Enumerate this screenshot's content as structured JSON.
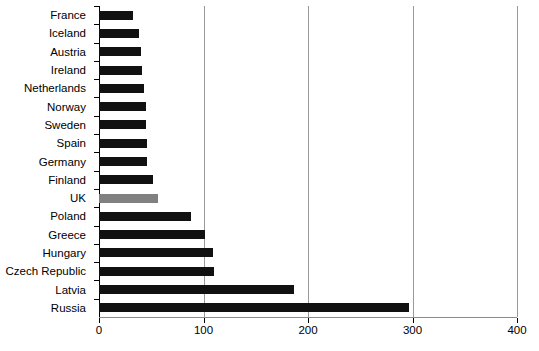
{
  "chart_data": {
    "type": "bar",
    "orientation": "horizontal",
    "title": "",
    "subtitle": "",
    "xlabel": "",
    "ylabel": "",
    "xlim": [
      0,
      400
    ],
    "xticks": [
      0,
      100,
      200,
      300,
      400
    ],
    "xtick_labels": [
      "0",
      "100",
      "200",
      "300",
      "400"
    ],
    "grid": "vertical",
    "legend": "none",
    "categories": [
      "France",
      "Iceland",
      "Austria",
      "Ireland",
      "Netherlands",
      "Norway",
      "Sweden",
      "Spain",
      "Germany",
      "Finland",
      "UK",
      "Poland",
      "Greece",
      "Hungary",
      "Czech Republic",
      "Latvia",
      "Russia"
    ],
    "values": [
      33,
      38,
      40,
      41,
      43,
      45,
      45,
      46,
      46,
      52,
      56,
      88,
      101,
      109,
      110,
      187,
      297
    ],
    "highlight_category": "UK",
    "colors": {
      "bar": "#111111",
      "bar_highlight": "#808080",
      "gridline": "#9a9a9a",
      "axis": "#000000",
      "background": "#ffffff",
      "text": "#000000"
    }
  }
}
